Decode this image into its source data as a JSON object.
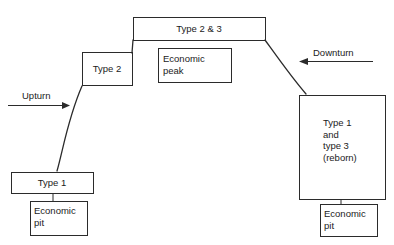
{
  "diagram": {
    "type": "economic-cycle-flow-diagram",
    "background_color": "#ffffff",
    "line_color": "#2b2b2b",
    "text_color": "#1b1b1b",
    "nodes": [
      {
        "id": "type1-left",
        "label": "Type 1",
        "align": "center",
        "x": 11,
        "y": 172,
        "w": 82,
        "h": 21
      },
      {
        "id": "economic-pit-left",
        "label": "Economic\npit",
        "align": "left",
        "x": 30,
        "y": 201,
        "w": 57,
        "h": 34
      },
      {
        "id": "type2",
        "label": "Type 2",
        "align": "center",
        "x": 82,
        "y": 52,
        "w": 50,
        "h": 33
      },
      {
        "id": "type2and3",
        "label": "Type 2 & 3",
        "align": "center",
        "x": 133,
        "y": 17,
        "w": 132,
        "h": 23
      },
      {
        "id": "economic-peak",
        "label": "Economic\npeak",
        "align": "left",
        "x": 158,
        "y": 48,
        "w": 73,
        "h": 34
      },
      {
        "id": "type1-and-type3-reborn",
        "label": "Type 1\nand\ntype 3\n(reborn)",
        "align": "left",
        "x": 299,
        "y": 95,
        "w": 86,
        "h": 104
      },
      {
        "id": "economic-pit-right",
        "label": "Economic\npit",
        "align": "left",
        "x": 320,
        "y": 204,
        "w": 57,
        "h": 32
      }
    ],
    "arrows": [
      {
        "id": "upturn",
        "label": "Upturn",
        "direction": "right",
        "label_x": 22,
        "label_y": 90,
        "line_x1": 8,
        "line_x2": 68,
        "line_y": 105
      },
      {
        "id": "downturn",
        "label": "Downturn",
        "direction": "left",
        "label_x": 313,
        "label_y": 47,
        "line_x1": 373,
        "line_x2": 300,
        "line_y": 61
      }
    ],
    "curves": [
      {
        "id": "upturn-curve",
        "from": "type1-left",
        "to": "type2",
        "path": "M 57 171 C 63 150 68 118 82 86"
      },
      {
        "id": "peak-left-connector",
        "from": "type2",
        "to": "type2and3",
        "path": "M 132 53 L 133 40"
      },
      {
        "id": "downturn-curve",
        "from": "type2and3",
        "to": "type1-and-type3-reborn",
        "path": "M 265 40 C 278 58 292 78 306 94"
      },
      {
        "id": "type1-to-pit-left",
        "from": "type1-left",
        "to": "economic-pit-left",
        "path": "M 53 193 L 53 201"
      },
      {
        "id": "reborn-to-pit-right",
        "from": "type1-and-type3-reborn",
        "to": "economic-pit-right",
        "path": "M 341 199 L 341 204"
      }
    ]
  }
}
